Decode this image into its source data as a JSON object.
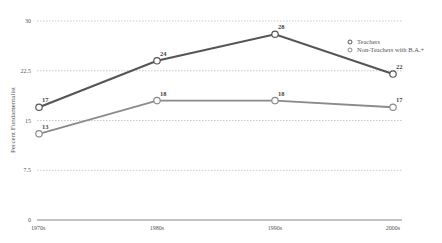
{
  "chart_data": {
    "type": "line",
    "title": "",
    "xlabel": "",
    "ylabel": "Percent Fundamentalist",
    "categories": [
      "1970s",
      "1980s",
      "1990s",
      "2000s"
    ],
    "yticks": [
      "0",
      "7.5",
      "15",
      "22.5",
      "30"
    ],
    "ylim": [
      0,
      30
    ],
    "grid": true,
    "legend_position": "upper right",
    "series": [
      {
        "name": "Teachers",
        "values": [
          17,
          24,
          28,
          22
        ],
        "color": "#555555"
      },
      {
        "name": "Non-Teachers with B.A.+",
        "values": [
          13,
          18,
          18,
          17
        ],
        "color": "#8a8a8a"
      }
    ]
  }
}
